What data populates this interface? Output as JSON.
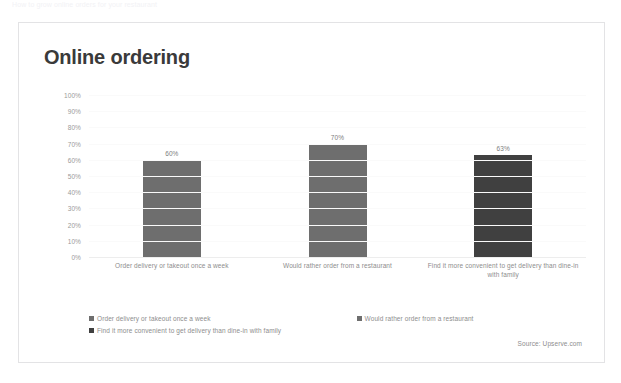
{
  "page": {
    "top_strip_text": "How to grow online orders for your restaurant"
  },
  "card": {
    "title": "Online ordering",
    "source": "Source: Upserve.com"
  },
  "legend": {
    "items": [
      {
        "label": "Order delivery or takeout once a week",
        "color": "#6e6e6e"
      },
      {
        "label": "Would rather order from a restaurant",
        "color": "#6e6e6e"
      },
      {
        "label": "Find it more convenient to get delivery than dine-in with family",
        "color": "#404040"
      }
    ]
  },
  "chart_data": {
    "type": "bar",
    "title": "Online ordering",
    "xlabel": "",
    "ylabel": "",
    "ylim": [
      0,
      100
    ],
    "grid": true,
    "legend_position": "bottom",
    "categories": [
      "Order delivery or takeout once a week",
      "Would rather order from a restaurant",
      "Find it more convenient to get delivery than dine-in with family"
    ],
    "values": [
      60,
      70,
      63
    ],
    "value_labels": [
      "60%",
      "70%",
      "63%"
    ],
    "bar_colors": [
      "#6e6e6e",
      "#6e6e6e",
      "#404040"
    ],
    "ytick_labels": [
      "100%",
      "90%",
      "80%",
      "70%",
      "60%",
      "50%",
      "40%",
      "30%",
      "20%",
      "10%",
      "0%"
    ],
    "ytick_values": [
      100,
      90,
      80,
      70,
      60,
      50,
      40,
      30,
      20,
      10,
      0
    ]
  }
}
